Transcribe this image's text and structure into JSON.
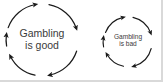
{
  "image": {
    "width": 163,
    "height": 82,
    "background_color": "#ffffff",
    "edge_shade_color": "#d9d9d9",
    "stroke_color": "#1a1a1a",
    "text_color": "#3a3a3a"
  },
  "diagram": {
    "type": "circular-arrow-cycle-pair",
    "cycles": [
      {
        "id": "gambling-is-good",
        "label_line1": "Gambling",
        "label_line2": "is good",
        "direction": "clockwise",
        "arc_count": 4,
        "center_x": 42,
        "center_y": 40,
        "radius": 36,
        "font_size": 10.5
      },
      {
        "id": "gambling-is-bad",
        "label_line1": "Gambling",
        "label_line2": "is bad",
        "direction": "clockwise",
        "arc_count": 4,
        "center_x": 128,
        "center_y": 42,
        "radius": 25,
        "font_size": 6.6
      }
    ]
  }
}
